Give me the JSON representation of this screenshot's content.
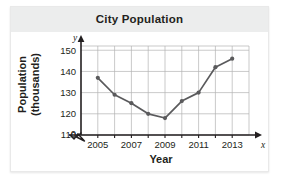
{
  "figure": {
    "title": "City Population",
    "xlabel": "Year",
    "ylabel_line1": "Population",
    "ylabel_line2": "(thousands)",
    "x_axis_letter": "x",
    "y_axis_letter": "y",
    "zero_label": "0"
  },
  "chart_data": {
    "type": "line",
    "title": "City Population",
    "xlabel": "Year",
    "ylabel": "Population (thousands)",
    "x": [
      2005,
      2006,
      2007,
      2008,
      2009,
      2010,
      2011,
      2012,
      2013
    ],
    "values": [
      137,
      129,
      125,
      120,
      118,
      126,
      130,
      142,
      146
    ],
    "xtick_labels": [
      "2005",
      "2007",
      "2009",
      "2011",
      "2013"
    ],
    "xtick_values": [
      2005,
      2007,
      2009,
      2011,
      2013
    ],
    "ytick_labels": [
      "110",
      "120",
      "130",
      "140",
      "150"
    ],
    "ytick_values": [
      110,
      120,
      130,
      140,
      150
    ],
    "xlim": [
      2004,
      2014
    ],
    "ylim": [
      110,
      152
    ],
    "grid": true,
    "legend": null,
    "axis_break": "0",
    "series_color": "#5a5a5c",
    "grid_color": "#b3b3b3",
    "marker": "circle"
  },
  "colors": {
    "title_band": "#eceded",
    "text": "#231f20",
    "line": "#5a5a5c",
    "grid": "#b3b3b3",
    "axis": "#231f20",
    "page_background": "#ffffff"
  }
}
